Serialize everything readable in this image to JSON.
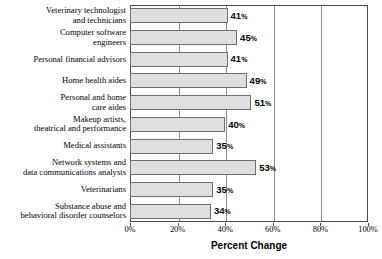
{
  "chart_data": {
    "type": "bar",
    "orientation": "horizontal",
    "title": "",
    "xlabel": "Percent Change",
    "ylabel": "",
    "xlim": [
      0,
      100
    ],
    "xticks": [
      "0%",
      "20%",
      "40%",
      "60%",
      "80%",
      "100%"
    ],
    "xtick_values": [
      0,
      20,
      40,
      60,
      80,
      100
    ],
    "grid": true,
    "legend": "none",
    "value_suffix": "%",
    "categories": [
      "Veterinary technologist and technicians",
      "Computer software engineers",
      "Personal financial advisors",
      "Home health aides",
      "Personal and home care aides",
      "Makeup artists, theatrical and performance",
      "Medical assistants",
      "Network systems and data communications analysts",
      "Veterinarians",
      "Substance abuse and behavioral disorder counselors"
    ],
    "category_lines": [
      [
        "Veterinary technologist",
        "and technicians"
      ],
      [
        "Computer software",
        "engineers"
      ],
      [
        "Personal financial advisors"
      ],
      [
        "Home health aides"
      ],
      [
        "Personal and home",
        "care aides"
      ],
      [
        "Makeup artists,",
        "theatrical and performance"
      ],
      [
        "Medical assistants"
      ],
      [
        "Network systems and",
        "data communications analysts"
      ],
      [
        "Veterinarians"
      ],
      [
        "Substance abuse and",
        "behavioral disorder counselors"
      ]
    ],
    "values": [
      41,
      45,
      41,
      49,
      51,
      40,
      35,
      53,
      35,
      34
    ],
    "value_labels": [
      "41",
      "45",
      "41",
      "49",
      "51",
      "40",
      "35",
      "53",
      "35",
      "34"
    ],
    "colors": {
      "bar_fill": "#dedede",
      "bar_border": "#6e6e6e",
      "frame": "#4a4a4a",
      "gridline": "#8c8c8c",
      "text": "#000000",
      "background": "#ffffff"
    }
  }
}
